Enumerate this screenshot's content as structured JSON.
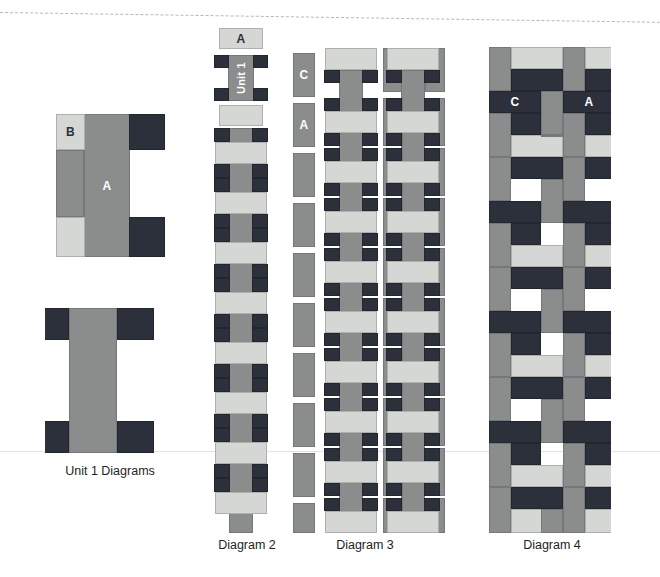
{
  "page": {
    "background": "#ffffff",
    "rules": {
      "top_dashed": true,
      "mid_hairline": true
    }
  },
  "palette": {
    "mid_gray": "#8b8d8c",
    "light_gray": "#d5d7d4",
    "dark_navy": "#2b303a",
    "dark_slate": "#3b414c",
    "text": "#231f20",
    "label_light": "#ffffff"
  },
  "captions": {
    "unit1": "Unit 1 Diagrams",
    "diagram2": "Diagram 2",
    "diagram3": "Diagram 3",
    "diagram4": "Diagram 4"
  },
  "unit1": {
    "top_diagram": {
      "label_a": "A",
      "label_b": "B",
      "pieces": [
        {
          "name": "paver-a-main",
          "tone": "mid",
          "x": 29,
          "y": 9,
          "w": 46,
          "h": 143,
          "label": "A"
        },
        {
          "name": "paver-b-top",
          "tone": "light",
          "x": 1,
          "y": 9,
          "w": 29,
          "h": 36,
          "label": "B"
        },
        {
          "name": "paver-b-bottom",
          "tone": "light",
          "x": 1,
          "y": 112,
          "w": 29,
          "h": 40,
          "label": ""
        },
        {
          "name": "paver-dark-top",
          "tone": "dark",
          "x": 74,
          "y": 9,
          "w": 36,
          "h": 36,
          "label": ""
        },
        {
          "name": "paver-dark-bottom",
          "tone": "dark",
          "x": 74,
          "y": 112,
          "w": 36,
          "h": 40,
          "label": ""
        },
        {
          "name": "paver-fill-left",
          "tone": "mid",
          "x": 1,
          "y": 45,
          "w": 28,
          "h": 67,
          "label": ""
        }
      ]
    },
    "bottom_diagram": {
      "pieces": [
        {
          "name": "paver-center-column",
          "tone": "mid",
          "x": 24,
          "y": 3,
          "w": 48,
          "h": 145,
          "label": ""
        },
        {
          "name": "paver-corner-tl",
          "tone": "dark",
          "x": -13,
          "y": 3,
          "w": 37,
          "h": 32,
          "label": ""
        },
        {
          "name": "paver-corner-tr",
          "tone": "dark",
          "x": 72,
          "y": 3,
          "w": 37,
          "h": 32,
          "label": ""
        },
        {
          "name": "paver-corner-bl",
          "tone": "dark",
          "x": -13,
          "y": 116,
          "w": 37,
          "h": 32,
          "label": ""
        },
        {
          "name": "paver-corner-br",
          "tone": "dark",
          "x": 72,
          "y": 116,
          "w": 37,
          "h": 32,
          "label": ""
        }
      ]
    }
  },
  "diagram2": {
    "legend": {
      "swatch_a_label": "A",
      "unit1_label": "Unit 1",
      "swatch_plain_label": ""
    },
    "column": {
      "description": "vertical mid-gray column with light-gray cross bars and dark corner squares",
      "repeat_count": 8
    }
  },
  "diagram3": {
    "labels": {
      "c": "C",
      "a": "A"
    },
    "columns": 2,
    "description": "two interlocking basketweave columns with left-edge half tiles labeled C and A"
  },
  "diagram4": {
    "labels": {
      "c": "C",
      "a": "A"
    },
    "description": "full basketweave field of mid-gray, light-gray and dark navy pavers"
  }
}
